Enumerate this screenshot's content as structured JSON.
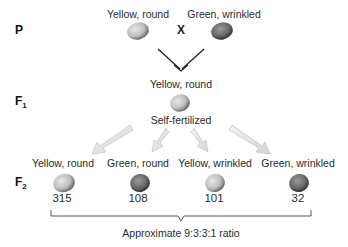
{
  "generations": {
    "p": {
      "label": "P"
    },
    "f1": {
      "label": "F",
      "sub": "1"
    },
    "f2": {
      "label": "F",
      "sub": "2"
    }
  },
  "parents": [
    {
      "label": "Yellow, round",
      "color": "#c9c9c9"
    },
    {
      "label": "Green, wrinkled",
      "color": "#6e6e6e"
    }
  ],
  "cross_symbol": "X",
  "f1": {
    "label": "Yellow, round",
    "note": "Self-fertilized",
    "color": "#a9a9a9"
  },
  "f2": [
    {
      "label": "Yellow, round",
      "count": "315",
      "color": "#cfcfcf"
    },
    {
      "label": "Green, round",
      "count": "108",
      "color": "#6a6a6a"
    },
    {
      "label": "Yellow, wrinkled",
      "count": "101",
      "color": "#bdbdbd"
    },
    {
      "label": "Green, wrinkled",
      "count": "32",
      "color": "#777777"
    }
  ],
  "ratio_label": "Approximate 9:3:3:1 ratio"
}
